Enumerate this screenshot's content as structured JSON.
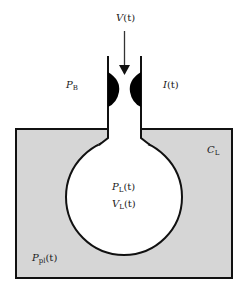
{
  "diagram": {
    "type": "lung-compartment-model",
    "colors": {
      "pleural_fill": "#d6d6d6",
      "stroke": "#111111",
      "lung_fill": "#ffffff",
      "airway_resistance": "#000000"
    },
    "labels": {
      "flow": {
        "symbol": "V",
        "arg": "(t)"
      },
      "body_pressure": {
        "symbol": "P",
        "sub": "B"
      },
      "inertance": {
        "symbol": "I",
        "arg": "(t)"
      },
      "compliance": {
        "symbol": "C",
        "sub": "L"
      },
      "lung_pressure": {
        "symbol": "P",
        "sub": "L",
        "arg": "(t)"
      },
      "lung_volume": {
        "symbol": "V",
        "sub": "L",
        "arg": "(t)"
      },
      "pleural_pressure": {
        "symbol": "P",
        "sub": "pl",
        "arg": "(t)"
      }
    }
  }
}
